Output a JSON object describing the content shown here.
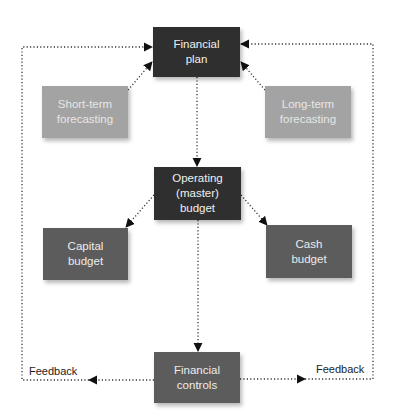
{
  "diagram": {
    "nodes": {
      "financial_plan": {
        "label": "Financial\nplan",
        "line1": "Financial",
        "line2": "plan",
        "shade": "#2f2f2f"
      },
      "short_term": {
        "line1": "Short-term",
        "line2": "forecasting",
        "shade": "#a3a3a3"
      },
      "long_term": {
        "line1": "Long-term",
        "line2": "forecasting",
        "shade": "#a3a3a3"
      },
      "operating": {
        "line1": "Operating",
        "line2": "(master)",
        "line3": "budget",
        "shade": "#2f2f2f"
      },
      "capital": {
        "line1": "Capital",
        "line2": "budget",
        "shade": "#5c5c5c"
      },
      "cash": {
        "line1": "Cash",
        "line2": "budget",
        "shade": "#5c5c5c"
      },
      "controls": {
        "line1": "Financial",
        "line2": "controls",
        "shade": "#5c5c5c"
      }
    },
    "edge_labels": {
      "feedback_left": "Feedback",
      "feedback_right": "Feedback"
    },
    "edges": [
      {
        "from": "short_term",
        "to": "financial_plan"
      },
      {
        "from": "long_term",
        "to": "financial_plan"
      },
      {
        "from": "financial_plan",
        "to": "operating"
      },
      {
        "from": "operating",
        "to": "capital"
      },
      {
        "from": "operating",
        "to": "cash"
      },
      {
        "from": "operating",
        "to": "controls"
      },
      {
        "from": "controls",
        "to": "financial_plan",
        "label": "Feedback",
        "side": "left"
      },
      {
        "from": "controls",
        "to": "financial_plan",
        "label": "Feedback",
        "side": "right"
      }
    ]
  }
}
